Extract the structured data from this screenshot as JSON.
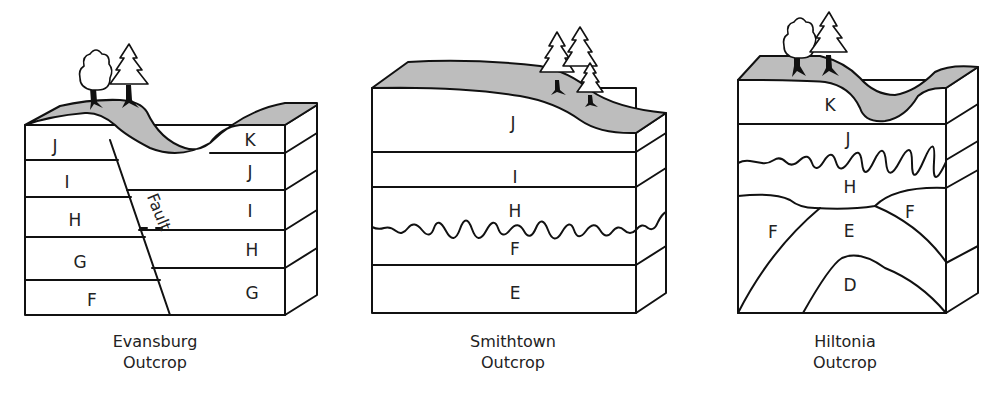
{
  "figure": {
    "outcrops": [
      {
        "id": "evansburg",
        "caption_line1": "Evansburg",
        "caption_line2": "Outcrop",
        "left_block_layers": [
          "J",
          "I",
          "H",
          "G",
          "F"
        ],
        "right_block_layers": [
          "K",
          "J",
          "I",
          "H",
          "G"
        ],
        "fault_label": "Fault",
        "trees": [
          "deciduous",
          "conifer"
        ]
      },
      {
        "id": "smithtown",
        "caption_line1": "Smithtown",
        "caption_line2": "Outcrop",
        "layers": [
          "J",
          "I",
          "H",
          "F",
          "E"
        ],
        "unconformity_between": [
          "H",
          "F"
        ],
        "trees": [
          "conifer",
          "conifer",
          "conifer"
        ]
      },
      {
        "id": "hiltonia",
        "caption_line1": "Hiltonia",
        "caption_line2": "Outcrop",
        "layers": [
          "K",
          "J",
          "H",
          "F",
          "E",
          "F",
          "D"
        ],
        "unconformity_between": [
          "J",
          "H"
        ],
        "trees": [
          "deciduous",
          "conifer"
        ]
      }
    ],
    "colors": {
      "soil": "#bdbdbd",
      "line": "#111111",
      "background": "#ffffff"
    }
  }
}
